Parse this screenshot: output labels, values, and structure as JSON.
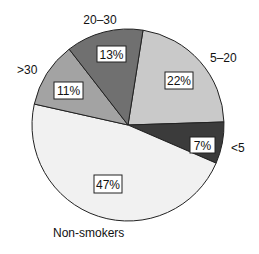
{
  "chart_data": {
    "type": "pie",
    "title": "",
    "categories": [
      "5–20",
      "<5",
      "Non-smokers",
      ">30",
      "20–30"
    ],
    "values": [
      22,
      7,
      47,
      11,
      13
    ],
    "value_labels": [
      "22%",
      "7%",
      "47%",
      "11%",
      "13%"
    ],
    "unit": "%",
    "start_angle_deg_clockwise_from_top": 9,
    "colors": [
      "#c9c9c9",
      "#3b3b3b",
      "#f1f1f1",
      "#a3a3a3",
      "#707070"
    ],
    "legend": "none (category labels placed outside slices)"
  },
  "labels": {
    "s0_cat": "5–20",
    "s0_pct": "22%",
    "s1_cat": "<5",
    "s1_pct": "7%",
    "s2_cat": "Non-smokers",
    "s2_pct": "47%",
    "s3_cat": ">30",
    "s3_pct": "11%",
    "s4_cat": "20–30",
    "s4_pct": "13%"
  }
}
